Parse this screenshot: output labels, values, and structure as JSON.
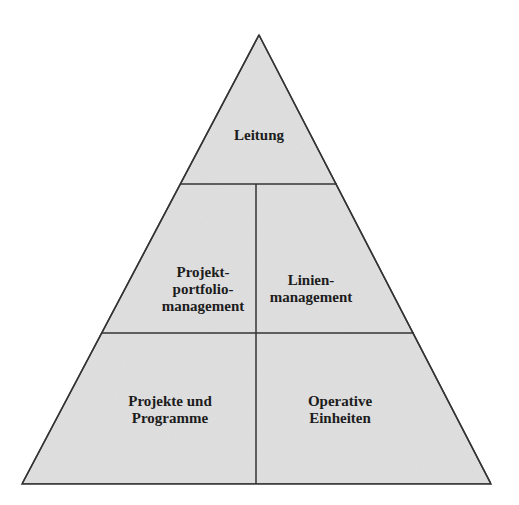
{
  "diagram": {
    "type": "pyramid",
    "colors": {
      "fill": "#e0e0e0",
      "stroke": "#333333",
      "text": "#1c1c1c",
      "background": "#ffffff"
    },
    "levels": [
      {
        "name": "top",
        "sections": [
          {
            "id": "leitung",
            "lines": [
              "Leitung"
            ]
          }
        ]
      },
      {
        "name": "middle",
        "sections": [
          {
            "id": "projektportfoliomanagement",
            "lines": [
              "Projekt-",
              "portfolio-",
              "management"
            ]
          },
          {
            "id": "linienmanagement",
            "lines": [
              "Linien-",
              "management"
            ]
          }
        ]
      },
      {
        "name": "bottom",
        "sections": [
          {
            "id": "projekte-und-programme",
            "lines": [
              "Projekte und",
              "Programme"
            ]
          },
          {
            "id": "operative-einheiten",
            "lines": [
              "Operative",
              "Einheiten"
            ]
          }
        ]
      }
    ]
  }
}
